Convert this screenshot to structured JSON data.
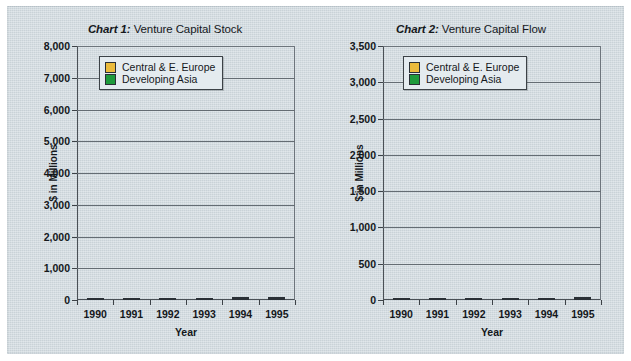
{
  "chart_data": [
    {
      "type": "bar",
      "id": "chart-1",
      "title": "Chart 1: Venture Capital Stock",
      "title_label": "Chart 1:",
      "title_rest": " Venture Capital Stock",
      "xlabel": "Year",
      "ylabel": "$ in Millions",
      "categories": [
        "1990",
        "1991",
        "1992",
        "1993",
        "1994",
        "1995"
      ],
      "ylim": [
        0,
        8000
      ],
      "yticks": [
        "0",
        "1,000",
        "2,000",
        "3,000",
        "4,000",
        "5,000",
        "6,000",
        "7,000",
        "8,000"
      ],
      "ytick_values": [
        0,
        1000,
        2000,
        3000,
        4000,
        5000,
        6000,
        7000,
        8000
      ],
      "grid": true,
      "stacked": true,
      "legend_position": "top-left",
      "series": [
        {
          "name": "Developing Asia",
          "color": "#1e9b3c",
          "values": [
            340,
            540,
            1260,
            1910,
            3050,
            4490
          ]
        },
        {
          "name": "Central & E. Europe",
          "color": "#ebbb3c",
          "values": [
            0,
            0,
            0,
            0,
            1000,
            2920
          ]
        }
      ]
    },
    {
      "type": "bar",
      "id": "chart-2",
      "title": "Chart 2: Venture Capital Flow",
      "title_label": "Chart 2:",
      "title_rest": " Venture Capital Flow",
      "xlabel": "Year",
      "ylabel": "$ in Millions",
      "categories": [
        "1990",
        "1991",
        "1992",
        "1993",
        "1994",
        "1995"
      ],
      "ylim": [
        0,
        3500
      ],
      "yticks": [
        "0",
        "500",
        "1,000",
        "1,500",
        "2,000",
        "2,500",
        "3,000",
        "3,500"
      ],
      "ytick_values": [
        0,
        500,
        1000,
        1500,
        2000,
        2500,
        3000,
        3500
      ],
      "grid": true,
      "stacked": true,
      "legend_position": "top-left",
      "series": [
        {
          "name": "Developing Asia",
          "color": "#1e9b3c",
          "values": [
            115,
            145,
            620,
            745,
            1025,
            1180
          ]
        },
        {
          "name": "Central & E. Europe",
          "color": "#ebbb3c",
          "values": [
            0,
            0,
            0,
            0,
            0,
            1750
          ]
        }
      ]
    }
  ],
  "legend": {
    "entries": [
      {
        "label": "Central & E. Europe",
        "color": "#ebbb3c"
      },
      {
        "label": "Developing Asia",
        "color": "#1e9b3c"
      }
    ]
  },
  "colors": {
    "green": "#1e9b3c",
    "yellow": "#ebbb3c",
    "panel_background": "#cdd7dd",
    "axis": "#3c4247"
  }
}
